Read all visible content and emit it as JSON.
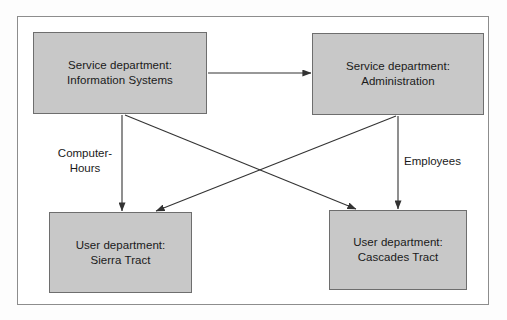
{
  "diagram": {
    "frame": {
      "border_color": "#8d8d8d"
    },
    "style": {
      "box_fill": "#c8c8c8",
      "box_border": "#6e6e6e",
      "text_color": "#1a1a1a",
      "connector_color": "#333333"
    },
    "boxes": [
      {
        "id": "information-systems",
        "line1": "Service department:",
        "line2": "Information Systems"
      },
      {
        "id": "administration",
        "line1": "Service department:",
        "line2": "Administration"
      },
      {
        "id": "sierra-tract",
        "line1": "User department:",
        "line2": "Sierra Tract"
      },
      {
        "id": "cascades-tract",
        "line1": "User department:",
        "line2": "Cascades Tract"
      }
    ],
    "edge_labels": [
      {
        "id": "computer-hours",
        "text": "Computer-\nHours",
        "line1": "Computer-",
        "line2": "Hours"
      },
      {
        "id": "employees",
        "text": "Employees",
        "line1": "Employees",
        "line2": ""
      }
    ],
    "connectors": [
      {
        "id": "is-to-admin",
        "from": "information-systems",
        "to": "administration",
        "label": ""
      },
      {
        "id": "is-to-sierra",
        "from": "information-systems",
        "to": "sierra-tract",
        "label": "Computer-Hours"
      },
      {
        "id": "is-to-cascades",
        "from": "information-systems",
        "to": "cascades-tract",
        "label": ""
      },
      {
        "id": "admin-to-sierra",
        "from": "administration",
        "to": "sierra-tract",
        "label": ""
      },
      {
        "id": "admin-to-cascades",
        "from": "administration",
        "to": "cascades-tract",
        "label": "Employees"
      }
    ]
  }
}
